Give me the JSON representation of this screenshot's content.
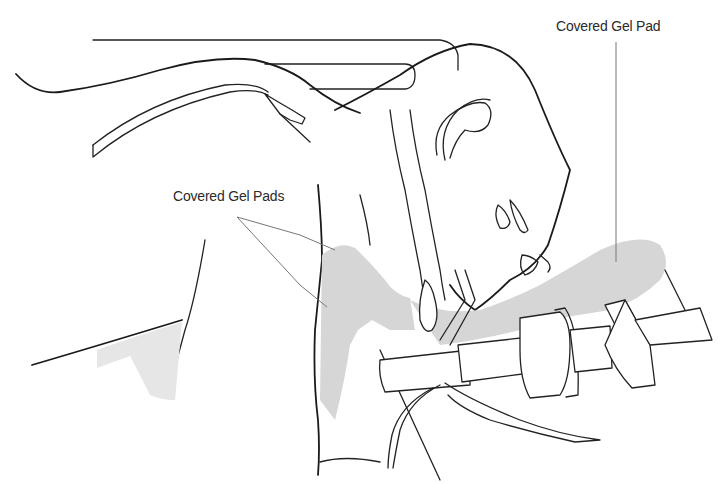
{
  "figure": {
    "type": "medical-illustration",
    "colors": {
      "background": "#ffffff",
      "line": "#222222",
      "gel_pad": "#d6d6d6",
      "leader_line": "#777777",
      "label_text": "#2a2a2a"
    }
  },
  "labels": {
    "head_pad": "Covered Gel Pad",
    "chest_pads": "Covered Gel Pads"
  }
}
